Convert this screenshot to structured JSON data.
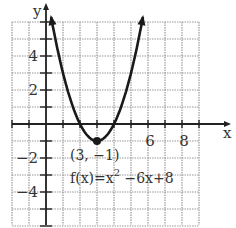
{
  "chart_data": {
    "type": "line",
    "title": "",
    "function_label": "f(x)=x^2 -6x+8",
    "function_label_parts": {
      "base": "f(x)=x",
      "exp": "2",
      "rest": " −6x+8"
    },
    "vertex": {
      "x": 3,
      "y": -1,
      "label": "(3, −1)"
    },
    "xlabel": "x",
    "ylabel": "y",
    "xlim": [
      -2,
      9
    ],
    "ylim": [
      -6,
      6
    ],
    "grid": true,
    "x_tick_labels": [
      {
        "value": 6,
        "text": "6"
      },
      {
        "value": 8,
        "text": "8"
      }
    ],
    "y_tick_labels": [
      {
        "value": 4,
        "text": "4"
      },
      {
        "value": 2,
        "text": "2"
      },
      {
        "value": -2,
        "text": "−2"
      },
      {
        "value": -4,
        "text": "−4"
      }
    ],
    "series": [
      {
        "name": "f(x)=x^2-6x+8",
        "x": [
          0.3,
          1,
          2,
          3,
          4,
          5,
          5.7
        ],
        "y": [
          6.29,
          3,
          0,
          -1,
          0,
          3,
          6.29
        ]
      }
    ],
    "colors": {
      "grid": "#9a9a9a",
      "axis": "#222222",
      "curve": "#1a1a1a"
    }
  }
}
